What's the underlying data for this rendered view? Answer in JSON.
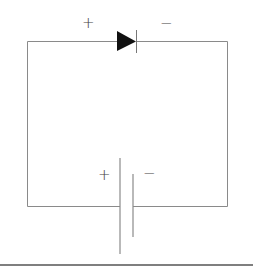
{
  "diagram": {
    "type": "circuit",
    "components": [
      {
        "id": "diode",
        "kind": "diode",
        "orientation": "forward, pointing right",
        "terminal_labels": {
          "anode": "+",
          "cathode": "−"
        }
      },
      {
        "id": "battery",
        "kind": "cell",
        "terminal_labels": {
          "positive": "+",
          "negative": "−"
        }
      }
    ],
    "labels": {
      "diode_plus": "+",
      "diode_minus": "−",
      "battery_plus": "+",
      "battery_minus": "−"
    },
    "colors": {
      "wire": "#8a8a8a",
      "diode_fill": "#111111",
      "rule": "#555555"
    }
  }
}
